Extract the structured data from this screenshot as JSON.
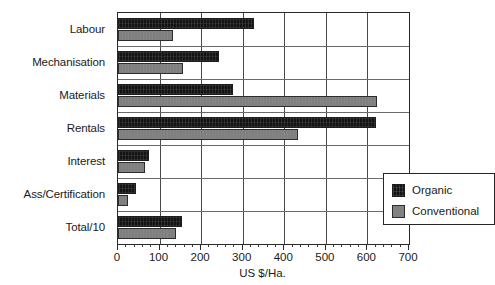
{
  "chart_data": {
    "type": "bar",
    "orientation": "horizontal",
    "title": "",
    "xlabel": "US $/Ha.",
    "ylabel": "",
    "xlim": [
      0,
      700
    ],
    "xticks": [
      0,
      100,
      200,
      300,
      400,
      500,
      600,
      700
    ],
    "xticklabels": [
      "0",
      "100",
      "200",
      "300",
      "400",
      "500",
      "600",
      "700"
    ],
    "minor_tick_interval": 20,
    "grid": "vertical-and-horizontal",
    "legend_position": "inside-lower-right",
    "categories": [
      "Labour",
      "Mechanisation",
      "Materials",
      "Rentals",
      "Interest",
      "Ass/Certification",
      "Total/10"
    ],
    "series": [
      {
        "name": "Organic",
        "color": "#141414",
        "values": [
          327,
          243,
          277,
          620,
          75,
          43,
          155
        ]
      },
      {
        "name": "Conventional",
        "color": "#7f7f7f",
        "values": [
          132,
          156,
          623,
          432,
          65,
          24,
          140
        ]
      }
    ]
  },
  "legend": {
    "entries": [
      {
        "label": "Organic",
        "swatch": "organic-swatch"
      },
      {
        "label": "Conventional",
        "swatch": "conventional-swatch"
      }
    ]
  },
  "axis": {
    "x_title": "US $/Ha."
  }
}
